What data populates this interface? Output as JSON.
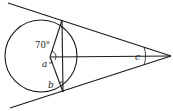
{
  "diagram": {
    "type": "geometry",
    "labels": {
      "angle_given": "70°",
      "angle_a": "a",
      "angle_b": "b",
      "angle_c": "c"
    },
    "colors": {
      "stroke": "#1a1a1a",
      "background": "#ffffff"
    }
  }
}
